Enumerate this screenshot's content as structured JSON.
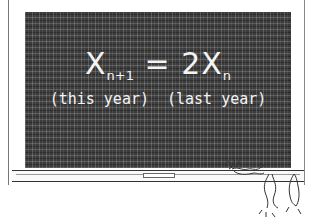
{
  "illustration": {
    "subject": "chalkboard with equation",
    "equation": {
      "lhs": "X",
      "lhs_subscript": "n+1",
      "operator": "=",
      "rhs_coefficient": "2",
      "rhs": "X",
      "rhs_subscript": "n"
    },
    "labels": {
      "left": "(this year)",
      "right": "(last year)"
    },
    "colors": {
      "board": "#3c3c3c",
      "chalk": "#f4f4f4",
      "background": "#ffffff"
    },
    "decorations": [
      "chalk-piece-on-ledge",
      "cartoon-critters-on-ledge"
    ]
  }
}
